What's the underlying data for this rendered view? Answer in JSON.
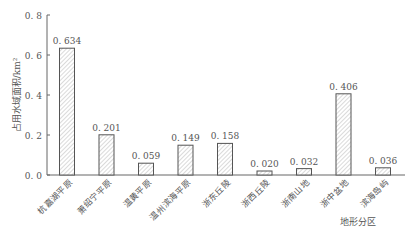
{
  "chart_data": {
    "type": "bar",
    "title": "",
    "xlabel": "地形分区",
    "ylabel": "占用水域面积/km²",
    "ylim": [
      0,
      0.8
    ],
    "yticks": [
      "0.0",
      "0.2",
      "0.4",
      "0.6",
      "0.8"
    ],
    "grid": false,
    "legend": null,
    "bar_style": "hatched",
    "categories": [
      "杭嘉湖平原",
      "萧绍宁平原",
      "温黄平原",
      "温州滨海平原",
      "浙东丘陵",
      "浙西丘陵",
      "浙南山地",
      "浙中盆地",
      "滨海岛屿"
    ],
    "values": [
      0.634,
      0.201,
      0.059,
      0.149,
      0.158,
      0.02,
      0.032,
      0.406,
      0.036
    ],
    "value_labels": [
      "0.634",
      "0.201",
      "0.059",
      "0.149",
      "0.158",
      "0.020",
      "0.032",
      "0.406",
      "0.036"
    ]
  }
}
